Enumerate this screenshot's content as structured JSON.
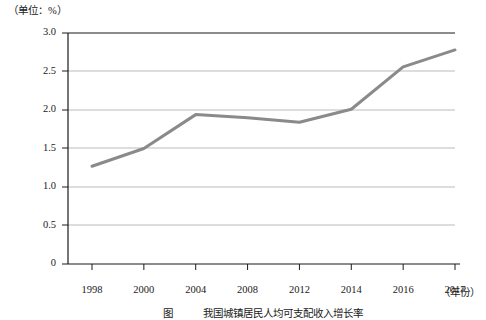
{
  "unit_label": "（单位：%）",
  "x_axis_name": "（年份）",
  "caption": "　　　　图　　　我国城镇居民人均可支配收入增长率",
  "colors": {
    "line": "#8a8a8a",
    "gridline": "#a9a9a9",
    "axis": "#1a1a1a",
    "text": "#1a1a1a",
    "background": "#ffffff"
  },
  "chart_data": {
    "type": "line",
    "title": "",
    "subtitle": "",
    "xlabel": "（年份）",
    "ylabel": "（单位：%）",
    "categories": [
      "1998",
      "2000",
      "2004",
      "2008",
      "2012",
      "2014",
      "2016",
      "2017"
    ],
    "series": [
      {
        "name": "比重",
        "values": [
          1.27,
          1.5,
          1.94,
          1.9,
          1.84,
          2.01,
          2.56,
          2.78
        ]
      }
    ],
    "ylim": [
      0,
      3.0
    ],
    "yticks": [
      0,
      0.5,
      1.0,
      1.5,
      2.0,
      2.5,
      3.0
    ],
    "ytick_labels": [
      "0",
      "0.5",
      "1.0",
      "1.5",
      "2.0",
      "2.5",
      "3.0"
    ],
    "xtick_labels": [
      "1998",
      "2000",
      "2004",
      "2008",
      "2012",
      "2014",
      "2016",
      "2017"
    ],
    "grid": true,
    "grid_axis": "y",
    "legend": false,
    "legend_position": "none",
    "markers": false,
    "line_color": "#8a8a8a",
    "line_width": 3
  }
}
